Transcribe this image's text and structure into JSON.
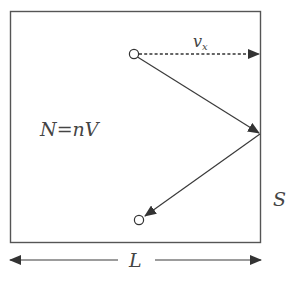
{
  "diagram": {
    "type": "particle-wall-collision",
    "labels": {
      "velocity": "v",
      "velocity_subscript": "x",
      "count_lhs": "N",
      "count_eq": "=",
      "count_rhs": "nV",
      "wall_area": "S",
      "length": "L"
    },
    "colors": {
      "line": "#3a3a3a",
      "box": "#555555",
      "text": "#444444",
      "background": "#ffffff"
    },
    "elements": [
      {
        "name": "container-box",
        "kind": "rectangle"
      },
      {
        "name": "start-particle",
        "kind": "open-circle"
      },
      {
        "name": "velocity-x-arrow",
        "kind": "dashed-arrow",
        "label": "v_x"
      },
      {
        "name": "incoming-path",
        "kind": "solid-arrow"
      },
      {
        "name": "reflected-path",
        "kind": "solid-arrow"
      },
      {
        "name": "end-particle",
        "kind": "open-circle"
      },
      {
        "name": "length-dimension",
        "kind": "double-arrow",
        "label": "L"
      },
      {
        "name": "wall-area-label",
        "kind": "text",
        "label": "S"
      },
      {
        "name": "particle-count-equation",
        "kind": "text",
        "label": "N = nV"
      }
    ]
  }
}
